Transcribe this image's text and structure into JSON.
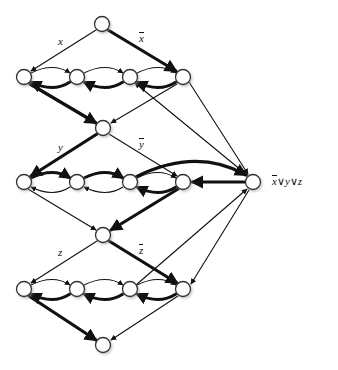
{
  "figure": {
    "background_color": "#ffffff",
    "ink_color": "#111111"
  },
  "labels": {
    "variable_x_true": "x",
    "variable_x_false": "x",
    "variable_y_true": "y",
    "variable_y_false": "y",
    "variable_z_true": "z",
    "variable_z_false": "z",
    "clause": {
      "lit1": "x",
      "op1": "∨",
      "lit2": "y",
      "op2": "∨",
      "lit3": "z"
    }
  },
  "graph_data": {
    "type": "diagram",
    "node_radius": 7.5,
    "nodes": [
      {
        "id": "s",
        "name": "start-node",
        "x": 102,
        "y": 24
      },
      {
        "id": "x1",
        "name": "x-row-node-1",
        "x": 24,
        "y": 77
      },
      {
        "id": "x2",
        "name": "x-row-node-2",
        "x": 77,
        "y": 77
      },
      {
        "id": "x3",
        "name": "x-row-node-3",
        "x": 130,
        "y": 77
      },
      {
        "id": "x4",
        "name": "x-row-node-4",
        "x": 183,
        "y": 77
      },
      {
        "id": "m1",
        "name": "x-y-junction-node",
        "x": 103,
        "y": 128
      },
      {
        "id": "y1",
        "name": "y-row-node-1",
        "x": 24,
        "y": 182
      },
      {
        "id": "y2",
        "name": "y-row-node-2",
        "x": 77,
        "y": 182
      },
      {
        "id": "y3",
        "name": "y-row-node-3",
        "x": 130,
        "y": 182
      },
      {
        "id": "y4",
        "name": "y-row-node-4",
        "x": 183,
        "y": 182
      },
      {
        "id": "m2",
        "name": "y-z-junction-node",
        "x": 103,
        "y": 235
      },
      {
        "id": "z1",
        "name": "z-row-node-1",
        "x": 24,
        "y": 289
      },
      {
        "id": "z2",
        "name": "z-row-node-2",
        "x": 77,
        "y": 289
      },
      {
        "id": "z3",
        "name": "z-row-node-3",
        "x": 130,
        "y": 289
      },
      {
        "id": "z4",
        "name": "z-row-node-4",
        "x": 183,
        "y": 289
      },
      {
        "id": "t",
        "name": "end-node",
        "x": 103,
        "y": 345
      },
      {
        "id": "c",
        "name": "clause-node",
        "x": 253,
        "y": 182
      }
    ],
    "label_positions": [
      {
        "key": "variable_x_true",
        "x": 58,
        "y": 36
      },
      {
        "key": "variable_x_false",
        "x": 139,
        "y": 33
      },
      {
        "key": "variable_y_true",
        "x": 58,
        "y": 142
      },
      {
        "key": "variable_y_false",
        "x": 139,
        "y": 139
      },
      {
        "key": "variable_z_true",
        "x": 58,
        "y": 247
      },
      {
        "key": "variable_z_false",
        "x": 139,
        "y": 245
      },
      {
        "key": "clause",
        "x": 272,
        "y": 176
      }
    ]
  }
}
